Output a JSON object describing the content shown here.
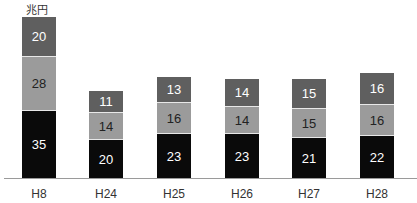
{
  "chart_data": {
    "type": "bar",
    "stacked": true,
    "title": "",
    "unit_label": "兆円",
    "xlabel": "",
    "ylabel": "兆円",
    "categories": [
      "H8",
      "H24",
      "H25",
      "H26",
      "H27",
      "H28"
    ],
    "series": [
      {
        "name": "bottom",
        "color": "#0a0a0a",
        "values": [
          35,
          20,
          23,
          23,
          21,
          22
        ]
      },
      {
        "name": "middle",
        "color": "#9b9b9b",
        "values": [
          28,
          14,
          16,
          14,
          15,
          16
        ]
      },
      {
        "name": "top",
        "color": "#5f5f5f",
        "values": [
          20,
          11,
          13,
          14,
          15,
          16
        ]
      }
    ],
    "grid": false,
    "legend": "none"
  }
}
